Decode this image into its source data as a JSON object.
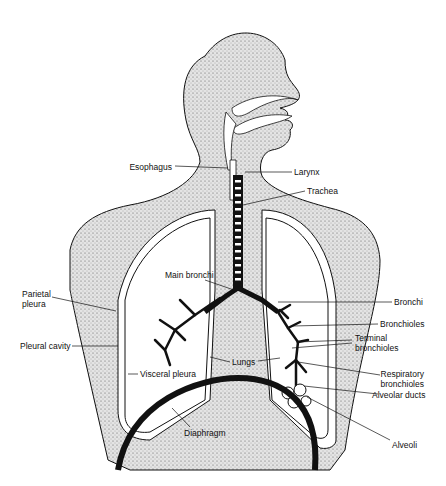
{
  "diagram": {
    "type": "anatomical-illustration",
    "colors": {
      "ink": "#111111",
      "stipple_fill": "#d8d8d8",
      "background": "#ffffff"
    },
    "labels": {
      "esophagus": "Esophagus",
      "larynx": "Larynx",
      "trachea": "Trachea",
      "main_bronchi": "Main bronchi",
      "bronchi": "Bronchi",
      "parietal_pleura_1": "Parietal",
      "parietal_pleura_2": "pleura",
      "bronchioles": "Bronchioles",
      "terminal_bronchioles_1": "Terminal",
      "terminal_bronchioles_2": "bronchioles",
      "pleural_cavity": "Pleural cavity",
      "lungs": "Lungs",
      "respiratory_bronchioles_1": "Respiratory",
      "respiratory_bronchioles_2": "bronchioles",
      "visceral_pleura": "Visceral pleura",
      "alveolar_ducts": "Alveolar ducts",
      "diaphragm": "Diaphragm",
      "alveoli": "Alveoli"
    }
  }
}
